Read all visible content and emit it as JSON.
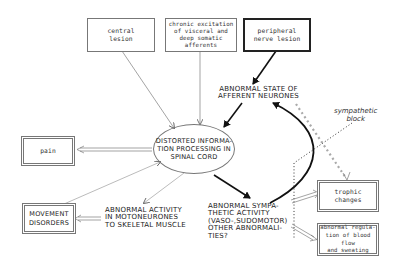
{
  "diagram": {
    "boxes": {
      "central_lesion": "central\nlesion",
      "chronic_excitation": "chronic excitation\nof visceral and\ndeep somatic\nafferents",
      "peripheral_nerve_lesion": "peripheral\nnerve lesion",
      "pain": "pain",
      "movement_disorders": "MOVEMENT\nDISORDERS",
      "trophic_changes": "trophic\nchanges",
      "abnormal_regulation": "abnormal regula-\ntion of blood flow\nand sweating"
    },
    "nodes": {
      "abnormal_state": "ABNORMAL STATE OF\nAFFERENT NEURONES",
      "distorted_processing": "DISTORTED INFORMA-\nTION PROCESSING IN\nSPINAL CORD",
      "abnormal_motoneurones": "ABNORMAL ACTIVITY\nIN MOTONEURONES\nTO SKELETAL MUSCLE",
      "abnormal_sympathetic": "ABNORMAL SYMPA-\nTHETIC ACTIVITY\n(VASO-,SUDOMOTOR)\nOTHER ABNORMALI-\nTIES?"
    },
    "annotations": {
      "sympathetic_block": "sympathetic\nblock"
    },
    "colors": {
      "line": "#555555",
      "thick_line": "#111111",
      "dotted": "#999999"
    }
  }
}
